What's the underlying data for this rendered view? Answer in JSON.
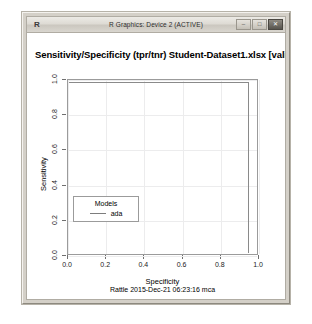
{
  "window": {
    "app_icon_label": "R",
    "title": "R Graphics: Device 2 (ACTIVE)",
    "buttons": {
      "minimize": "–",
      "maximize": "□",
      "close": "✕"
    }
  },
  "plot": {
    "title": "Sensitivity/Specificity (tpr/tnr)  Student-Dataset1.xlsx [valida",
    "legend": {
      "title": "Models",
      "entries": [
        {
          "label": "ada",
          "color": "#7d7d7d"
        }
      ]
    },
    "footer": "Rattle 2015-Dec-21 06:23:16 mca"
  },
  "chart_data": {
    "type": "line",
    "title": "Sensitivity/Specificity (tpr/tnr)  Student-Dataset1.xlsx [valida",
    "xlabel": "Specificity",
    "ylabel": "Sensitivity",
    "xlim": [
      0.0,
      1.0
    ],
    "ylim": [
      0.0,
      1.0
    ],
    "xticks": [
      "0.0",
      "0.2",
      "0.4",
      "0.6",
      "0.8",
      "1.0"
    ],
    "yticks": [
      "0.0",
      "0.2",
      "0.4",
      "0.6",
      "0.8",
      "1.0"
    ],
    "xtick_values": [
      0.0,
      0.2,
      0.4,
      0.6,
      0.8,
      1.0
    ],
    "ytick_values": [
      0.0,
      0.2,
      0.4,
      0.6,
      0.8,
      1.0
    ],
    "grid": true,
    "legend_position": "bottom-left",
    "annotation": "Rattle 2015-Dec-21 06:23:16 mca",
    "series": [
      {
        "name": "ada",
        "color": "#7d7d7d",
        "x": [
          0.0,
          0.95,
          1.0,
          1.0
        ],
        "y": [
          1.0,
          1.0,
          1.0,
          0.0
        ]
      }
    ]
  }
}
